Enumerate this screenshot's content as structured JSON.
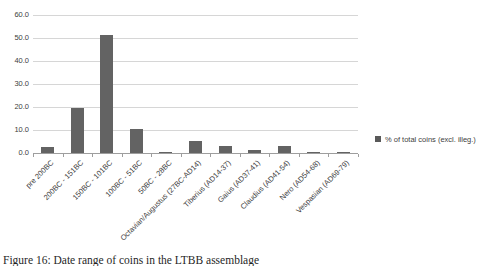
{
  "chart_data": {
    "type": "bar",
    "title": "",
    "categories": [
      "pre 200BC",
      "200BC - 151BC",
      "150BC - 101BC",
      "100BC - 51BC",
      "50BC - 28BC",
      "Octavian/Augustus (27BC-AD14)",
      "Tiberius (AD14-37)",
      "Gaius (AD37-41)",
      "Claudius (AD41-54)",
      "Nero (AD54-68)",
      "Vespasian (AD69-79)"
    ],
    "series": [
      {
        "name": "% of total coins (excl. illeg.)",
        "values": [
          2.5,
          19.5,
          51.5,
          10.5,
          0.4,
          5.3,
          3.0,
          1.3,
          3.0,
          0.5,
          0.3
        ]
      }
    ],
    "legend": "% of total coins (excl. illeg.)",
    "legend_position": "right",
    "xlabel": "",
    "ylabel": "",
    "ylim": [
      0,
      60
    ],
    "ytick_step": 10,
    "ytick_labels": [
      "0.0",
      "10.0",
      "20.0",
      "30.0",
      "40.0",
      "50.0",
      "60.0"
    ],
    "grid": true,
    "bar_color": "#636363"
  },
  "legend": {
    "marker_color": "#595959"
  },
  "caption": {
    "text": "Figure 16: Date range of coins in the LTBB assemblage"
  },
  "colors": {
    "background": "#ffffff",
    "gridline": "#d6d6d6",
    "axis": "#9e9e9e",
    "text": "#404040"
  }
}
